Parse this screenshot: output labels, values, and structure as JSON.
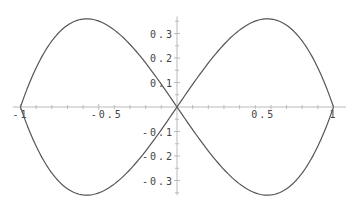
{
  "chart_data": {
    "type": "line",
    "title": "",
    "xlabel": "",
    "ylabel": "",
    "xlim": [
      -1.05,
      1.08
    ],
    "ylim": [
      -0.36,
      0.37
    ],
    "grid": false,
    "legend": null,
    "x_ticks": [
      {
        "value": -1,
        "label": "-1"
      },
      {
        "value": -0.5,
        "label": "-0.5"
      },
      {
        "value": 0.5,
        "label": "0.5"
      },
      {
        "value": 1,
        "label": "1"
      }
    ],
    "y_ticks": [
      {
        "value": 0.3,
        "label": "0.3"
      },
      {
        "value": 0.2,
        "label": "0.2"
      },
      {
        "value": 0.1,
        "label": "0.1"
      },
      {
        "value": -0.1,
        "label": "-0.1"
      },
      {
        "value": -0.2,
        "label": "-0.2"
      },
      {
        "value": -0.3,
        "label": "-0.3"
      }
    ],
    "series": [
      {
        "name": "curve",
        "color": "#555555",
        "points": [
          [
            1.0,
            0.0
          ],
          [
            0.98,
            0.036
          ],
          [
            0.95,
            0.085
          ],
          [
            0.9,
            0.16
          ],
          [
            0.85,
            0.221
          ],
          [
            0.8,
            0.27
          ],
          [
            0.75,
            0.307
          ],
          [
            0.7,
            0.334
          ],
          [
            0.65,
            0.35
          ],
          [
            0.6,
            0.359
          ],
          [
            0.55,
            0.359
          ],
          [
            0.5,
            0.351
          ],
          [
            0.45,
            0.335
          ],
          [
            0.4,
            0.314
          ],
          [
            0.35,
            0.287
          ],
          [
            0.3,
            0.255
          ],
          [
            0.25,
            0.219
          ],
          [
            0.2,
            0.179
          ],
          [
            0.15,
            0.137
          ],
          [
            0.1,
            0.093
          ],
          [
            0.05,
            0.047
          ],
          [
            0.0,
            0.0
          ],
          [
            -0.05,
            -0.047
          ],
          [
            -0.1,
            -0.093
          ],
          [
            -0.15,
            -0.137
          ],
          [
            -0.2,
            -0.179
          ],
          [
            -0.25,
            -0.219
          ],
          [
            -0.3,
            -0.255
          ],
          [
            -0.35,
            -0.287
          ],
          [
            -0.4,
            -0.314
          ],
          [
            -0.45,
            -0.335
          ],
          [
            -0.5,
            -0.351
          ],
          [
            -0.55,
            -0.359
          ],
          [
            -0.6,
            -0.359
          ],
          [
            -0.65,
            -0.35
          ],
          [
            -0.7,
            -0.334
          ],
          [
            -0.75,
            -0.307
          ],
          [
            -0.8,
            -0.27
          ],
          [
            -0.85,
            -0.221
          ],
          [
            -0.9,
            -0.16
          ],
          [
            -0.95,
            -0.085
          ],
          [
            -0.98,
            -0.036
          ],
          [
            -1.0,
            0.0
          ],
          [
            -0.98,
            0.036
          ],
          [
            -0.95,
            0.085
          ],
          [
            -0.9,
            0.16
          ],
          [
            -0.85,
            0.221
          ],
          [
            -0.8,
            0.27
          ],
          [
            -0.75,
            0.307
          ],
          [
            -0.7,
            0.334
          ],
          [
            -0.65,
            0.35
          ],
          [
            -0.6,
            0.359
          ],
          [
            -0.55,
            0.359
          ],
          [
            -0.5,
            0.351
          ],
          [
            -0.45,
            0.335
          ],
          [
            -0.4,
            0.314
          ],
          [
            -0.35,
            0.287
          ],
          [
            -0.3,
            0.255
          ],
          [
            -0.25,
            0.219
          ],
          [
            -0.2,
            0.179
          ],
          [
            -0.15,
            0.137
          ],
          [
            -0.1,
            0.093
          ],
          [
            -0.05,
            0.047
          ],
          [
            0.0,
            0.0
          ],
          [
            0.05,
            -0.047
          ],
          [
            0.1,
            -0.093
          ],
          [
            0.15,
            -0.137
          ],
          [
            0.2,
            -0.179
          ],
          [
            0.25,
            -0.219
          ],
          [
            0.3,
            -0.255
          ],
          [
            0.35,
            -0.287
          ],
          [
            0.4,
            -0.314
          ],
          [
            0.45,
            -0.335
          ],
          [
            0.5,
            -0.351
          ],
          [
            0.55,
            -0.359
          ],
          [
            0.6,
            -0.359
          ],
          [
            0.65,
            -0.35
          ],
          [
            0.7,
            -0.334
          ],
          [
            0.75,
            -0.307
          ],
          [
            0.8,
            -0.27
          ],
          [
            0.85,
            -0.221
          ],
          [
            0.9,
            -0.16
          ],
          [
            0.95,
            -0.085
          ],
          [
            0.98,
            -0.036
          ],
          [
            1.0,
            0.0
          ]
        ]
      }
    ]
  },
  "colors": {
    "axis": "#bbbbbb",
    "curve": "#555555",
    "text": "#444444"
  }
}
